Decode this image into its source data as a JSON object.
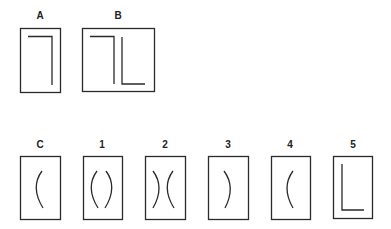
{
  "top_row": {
    "labels": {
      "a": "A",
      "b": "B"
    }
  },
  "bottom_row": {
    "labels": {
      "c": "C",
      "o1": "1",
      "o2": "2",
      "o3": "3",
      "o4": "4",
      "o5": "5"
    }
  },
  "colors": {
    "stroke": "#2a2a2a",
    "background": "#ffffff"
  }
}
